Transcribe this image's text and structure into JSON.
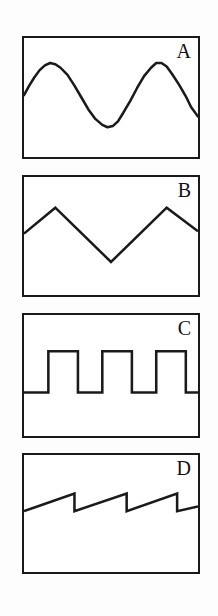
{
  "figure": {
    "background_color": "#fdfdfd",
    "ink_color": "#1a1a1a",
    "panel_fill": "#ffffff",
    "panel_border_px": 2,
    "stroke_width_px": 2.6
  },
  "panels": [
    {
      "id": "a",
      "label": "A",
      "waveform": "sine",
      "description": "smooth sinusoidal wave, two full cycles",
      "cycles": 2.0,
      "phase_start": "rising-at-midline"
    },
    {
      "id": "b",
      "label": "B",
      "waveform": "triangle",
      "description": "triangular wave, two peaks and one valley",
      "cycles": 1.5,
      "phase_start": "rising-at-midline"
    },
    {
      "id": "c",
      "label": "C",
      "waveform": "square",
      "description": "square wave, three full high pulses plus partial fourth",
      "cycles": 3.5,
      "phase_start": "low"
    },
    {
      "id": "d",
      "label": "D",
      "waveform": "sawtooth",
      "description": "sawtooth wave, three rising ramps with vertical drops",
      "cycles": 3.0,
      "phase_start": "rising"
    }
  ],
  "chart_data": {
    "type": "line",
    "xlabel": "",
    "ylabel": "",
    "grid": false,
    "legend": "none",
    "charts": [
      {
        "panel": "A",
        "waveform": "sine",
        "xlim": [
          0,
          1
        ],
        "ylim": [
          0,
          1
        ],
        "cycles": 2.0,
        "amplitude": 0.27,
        "midline": 0.48,
        "points": [
          [
            0.0,
            0.48
          ],
          [
            0.03,
            0.4
          ],
          [
            0.06,
            0.33
          ],
          [
            0.09,
            0.27
          ],
          [
            0.12,
            0.23
          ],
          [
            0.15,
            0.21
          ],
          [
            0.18,
            0.22
          ],
          [
            0.21,
            0.25
          ],
          [
            0.25,
            0.31
          ],
          [
            0.29,
            0.4
          ],
          [
            0.33,
            0.5
          ],
          [
            0.37,
            0.6
          ],
          [
            0.41,
            0.68
          ],
          [
            0.45,
            0.73
          ],
          [
            0.48,
            0.75
          ],
          [
            0.51,
            0.74
          ],
          [
            0.54,
            0.7
          ],
          [
            0.57,
            0.63
          ],
          [
            0.61,
            0.53
          ],
          [
            0.65,
            0.42
          ],
          [
            0.69,
            0.32
          ],
          [
            0.73,
            0.25
          ],
          [
            0.76,
            0.21
          ],
          [
            0.79,
            0.21
          ],
          [
            0.82,
            0.24
          ],
          [
            0.85,
            0.3
          ],
          [
            0.89,
            0.39
          ],
          [
            0.93,
            0.49
          ],
          [
            0.96,
            0.58
          ],
          [
            1.0,
            0.66
          ]
        ]
      },
      {
        "panel": "B",
        "waveform": "triangle",
        "xlim": [
          0,
          1
        ],
        "ylim": [
          0,
          1
        ],
        "cycles": 1.5,
        "peak_y": 0.26,
        "valley_y": 0.72,
        "points": [
          [
            0.0,
            0.48
          ],
          [
            0.18,
            0.26
          ],
          [
            0.5,
            0.72
          ],
          [
            0.82,
            0.26
          ],
          [
            1.0,
            0.46
          ]
        ]
      },
      {
        "panel": "C",
        "waveform": "square",
        "xlim": [
          0,
          1
        ],
        "ylim": [
          0,
          1
        ],
        "high_y": 0.3,
        "low_y": 0.64,
        "duty_cycle": 0.5,
        "cycles": 3.5,
        "points": [
          [
            0.0,
            0.64
          ],
          [
            0.14,
            0.64
          ],
          [
            0.14,
            0.3
          ],
          [
            0.31,
            0.3
          ],
          [
            0.31,
            0.64
          ],
          [
            0.45,
            0.64
          ],
          [
            0.45,
            0.3
          ],
          [
            0.62,
            0.3
          ],
          [
            0.62,
            0.64
          ],
          [
            0.76,
            0.64
          ],
          [
            0.76,
            0.3
          ],
          [
            0.93,
            0.3
          ],
          [
            0.93,
            0.64
          ],
          [
            1.0,
            0.64
          ]
        ]
      },
      {
        "panel": "D",
        "waveform": "sawtooth",
        "xlim": [
          0,
          1
        ],
        "ylim": [
          0,
          1
        ],
        "cycles": 3.0,
        "ramp_low_y": 0.48,
        "ramp_high_y": 0.33,
        "points": [
          [
            0.0,
            0.48
          ],
          [
            0.29,
            0.33
          ],
          [
            0.29,
            0.48
          ],
          [
            0.59,
            0.33
          ],
          [
            0.59,
            0.48
          ],
          [
            0.88,
            0.33
          ],
          [
            0.88,
            0.48
          ],
          [
            1.0,
            0.44
          ]
        ]
      }
    ]
  }
}
